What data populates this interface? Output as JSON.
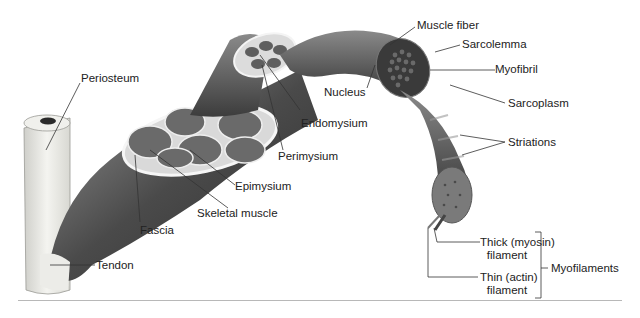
{
  "diagram": {
    "colors": {
      "tissue_dark": "#3a3a3a",
      "tissue_mid": "#6e6e6e",
      "bone": "#e8e8e4",
      "text": "#222222",
      "leader": "#333333",
      "rule": "#b8b8b8"
    },
    "labels": {
      "periosteum": "Periosteum",
      "endomysium": "Endomysium",
      "perimysium": "Perimysium",
      "epimysium": "Epimysium",
      "skeletal_muscle": "Skeletal muscle",
      "fascia": "Fascia",
      "tendon": "Tendon",
      "muscle_fiber": "Muscle fiber",
      "sarcolemma": "Sarcolemma",
      "myofibril": "Myofibril",
      "nucleus": "Nucleus",
      "sarcoplasm": "Sarcoplasm",
      "striations": "Striations",
      "thick_filament_1": "Thick (myosin)",
      "thick_filament_2": "filament",
      "thin_filament_1": "Thin (actin)",
      "thin_filament_2": "filament",
      "myofilaments": "Myofilaments"
    }
  }
}
